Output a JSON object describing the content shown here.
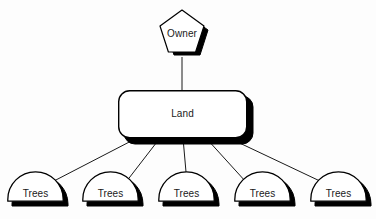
{
  "diagram": {
    "type": "hierarchy-tree",
    "background_color": "#fdfdfd",
    "stroke_color": "#000000",
    "fill_color": "#ffffff",
    "shadow_color": "#000000",
    "text_color": "#1a1a1a",
    "nodes": [
      {
        "id": "owner",
        "label": "Owner",
        "shape": "pentagon",
        "cx": 182,
        "cy": 33,
        "width": 46,
        "height": 47
      },
      {
        "id": "land",
        "label": "Land",
        "shape": "rounded-rectangle",
        "x": 118,
        "y": 90,
        "width": 129,
        "height": 48
      },
      {
        "id": "trees-1",
        "label": "Trees",
        "shape": "semicircle",
        "cx": 35,
        "cy": 200,
        "width": 56,
        "height": 29
      },
      {
        "id": "trees-2",
        "label": "Trees",
        "shape": "semicircle",
        "cx": 110,
        "cy": 200,
        "width": 56,
        "height": 29
      },
      {
        "id": "trees-3",
        "label": "Trees",
        "shape": "semicircle",
        "cx": 186,
        "cy": 200,
        "width": 56,
        "height": 29
      },
      {
        "id": "trees-4",
        "label": "Trees",
        "shape": "semicircle",
        "cx": 262,
        "cy": 200,
        "width": 56,
        "height": 29
      },
      {
        "id": "trees-5",
        "label": "Trees",
        "shape": "semicircle",
        "cx": 338,
        "cy": 200,
        "width": 56,
        "height": 29
      }
    ],
    "edges": [
      {
        "from": "owner",
        "to": "land",
        "x1": 182,
        "y1": 57,
        "x2": 182,
        "y2": 90
      },
      {
        "from": "land",
        "to": "trees-1",
        "x1": 137,
        "y1": 138,
        "x2": 52,
        "y2": 182
      },
      {
        "from": "land",
        "to": "trees-2",
        "x1": 160,
        "y1": 138,
        "x2": 126,
        "y2": 182
      },
      {
        "from": "land",
        "to": "trees-3",
        "x1": 183,
        "y1": 138,
        "x2": 186,
        "y2": 172
      },
      {
        "from": "land",
        "to": "trees-4",
        "x1": 206,
        "y1": 138,
        "x2": 246,
        "y2": 182
      },
      {
        "from": "land",
        "to": "trees-5",
        "x1": 229,
        "y1": 138,
        "x2": 322,
        "y2": 182
      }
    ]
  }
}
